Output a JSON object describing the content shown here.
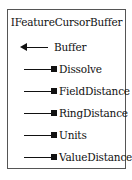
{
  "diagram": {
    "interface_name": "IFeatureCursorBuffer",
    "members": [
      {
        "name": "Buffer",
        "kind": "method",
        "connector": "arrow-left"
      },
      {
        "name": "Dissolve",
        "kind": "property",
        "connector": "square"
      },
      {
        "name": "FieldDistance",
        "kind": "property",
        "connector": "square"
      },
      {
        "name": "RingDistance",
        "kind": "property",
        "connector": "square"
      },
      {
        "name": "Units",
        "kind": "property",
        "connector": "square"
      },
      {
        "name": "ValueDistance",
        "kind": "property",
        "connector": "square"
      }
    ]
  }
}
